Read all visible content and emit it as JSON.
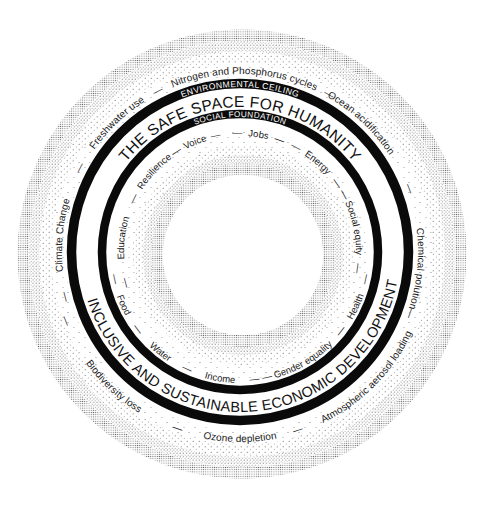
{
  "diagram": {
    "type": "doughnut-economics",
    "colors": {
      "background": "#ffffff",
      "ring": "#0a0a0a",
      "text": "#1a1a1a",
      "ring_text": "#ffffff",
      "stipple": "#6e6e6e"
    },
    "environmental_ceiling": {
      "label": "ENVIRONMENTAL CEILING",
      "boundaries_top": [
        {
          "label": "Climate Change",
          "offset": "26.5%"
        },
        {
          "label": "Freshwater use",
          "offset": "37.9%"
        },
        {
          "label": "Nitrogen and Phosphorus cycles",
          "offset": "50.4%"
        },
        {
          "label": "Ocean acidification",
          "offset": "62%"
        },
        {
          "label": "Chemical polution",
          "offset": "76.5%"
        }
      ],
      "boundaries_bottom": [
        {
          "label": "Biodiversity loss",
          "offset": "38%"
        },
        {
          "label": "Ozone depletion",
          "offset": "50%"
        },
        {
          "label": "Atmospheric aerosol loading",
          "offset": "62.6%"
        }
      ],
      "separators_top": [
        "21%",
        "32.7%",
        "42.5%",
        "58.2%",
        "69.3%",
        "80.5%"
      ],
      "separators_bottom": [
        "31%",
        "44.6%",
        "55%"
      ]
    },
    "safe_space": {
      "top_label": "THE SAFE SPACE FOR HUMANITY",
      "bottom_label": "INCLUSIVE AND SUSTAINABLE ECONOMIC DEVELOPMENT"
    },
    "social_foundation": {
      "label": "SOCIAL FOUNDATION",
      "dimensions_top": [
        {
          "label": "Education",
          "offset": "26.9%"
        },
        {
          "label": "Resilience",
          "offset": "37%"
        },
        {
          "label": "Voice",
          "offset": "43.8%"
        },
        {
          "label": "Jobs",
          "offset": "52.5%"
        },
        {
          "label": "Energy",
          "offset": "61.4%"
        },
        {
          "label": "Social equity",
          "offset": "71.7%"
        }
      ],
      "dimensions_bottom": [
        {
          "label": "Food",
          "offset": "31.8%"
        },
        {
          "label": "Water",
          "offset": "39.3%"
        },
        {
          "label": "Income",
          "offset": "47.5%"
        },
        {
          "label": "Gender equality",
          "offset": "58.4%"
        },
        {
          "label": "Health",
          "offset": "68%"
        }
      ],
      "separators_top": [
        "20.8%",
        "32.6%",
        "40.8%",
        "46.6%",
        "48.4%",
        "55.6%",
        "58.2%",
        "65.4%",
        "67.6%",
        "76.6%"
      ],
      "separators_bottom": [
        "28.2%",
        "35.3%",
        "43%",
        "51.6%",
        "53.2%",
        "64%",
        "72%"
      ]
    },
    "separator_glyph": "—"
  }
}
